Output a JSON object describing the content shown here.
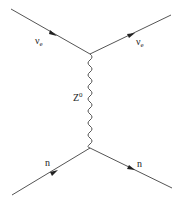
{
  "diagram": {
    "type": "feynman",
    "title": "",
    "line_color": "#555555",
    "vertices": {
      "top": {
        "x": 90,
        "y": 54
      },
      "bottom": {
        "x": 90,
        "y": 148
      }
    },
    "particles": {
      "incoming_neutrino": {
        "symbol": "ν",
        "subscript": "e"
      },
      "outgoing_neutrino": {
        "symbol": "ν",
        "subscript": "e"
      },
      "propagator": {
        "symbol": "Z",
        "superscript": "0"
      },
      "incoming_neutron": {
        "symbol": "n"
      },
      "outgoing_neutron": {
        "symbol": "n"
      }
    }
  }
}
